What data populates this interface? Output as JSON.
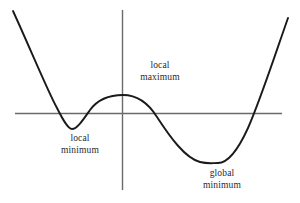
{
  "figure": {
    "background_color": "#ffffff",
    "curve_color": "#1a1a1a",
    "axis_color": "#6a6a6a",
    "label_color": "#2a2a2a"
  },
  "annotations": [
    {
      "id": "local-maximum",
      "line1": "local",
      "line2": "maximum",
      "x": 160,
      "y": 60
    },
    {
      "id": "local-minimum",
      "line1": "local",
      "line2": "minimum",
      "x": 80,
      "y": 133
    },
    {
      "id": "global-minimum",
      "line1": "global",
      "line2": "minimum",
      "x": 222,
      "y": 168
    }
  ],
  "chart_data": {
    "type": "line",
    "title": "",
    "xlabel": "",
    "ylabel": "",
    "grid": false,
    "legend": null,
    "axes": {
      "x_axis": {
        "y_pixel": 113,
        "x_start_pixel": 15,
        "x_end_pixel": 282
      },
      "y_axis": {
        "x_pixel": 122,
        "y_start_pixel": 10,
        "y_end_pixel": 190
      },
      "xlim": [
        -2.45,
        2.45
      ],
      "ylim": [
        -1.95,
        2.4
      ]
    },
    "critical_points": [
      {
        "name": "local minimum",
        "x": -1.0,
        "y": -0.38,
        "x_pixel": 72,
        "y_pixel": 129
      },
      {
        "name": "local maximum",
        "x": 0.02,
        "y": 0.2,
        "x_pixel": 123,
        "y_pixel": 95
      },
      {
        "name": "global minimum",
        "x": 1.78,
        "y": -0.57,
        "x_pixel": 218,
        "y_pixel": 163
      }
    ],
    "x_intercepts_pixel": [
      42,
      97,
      151,
      265
    ],
    "curve_endpoints_pixel": [
      {
        "x_pixel": 13,
        "y_pixel": 11
      },
      {
        "x_pixel": 288,
        "y_pixel": 18
      }
    ],
    "path": "M 13,11 C 30,48 48,92 57,108 C 63,120 68,129 72,129 C 77,129 83,120 90,110 C 98,99 110,95 123,95 C 136,95 147,101 157,117 C 170,137 185,158 200,162 C 208,164 212,163 218,163 C 228,163 238,150 248,128 C 260,101 275,55 288,18"
  }
}
